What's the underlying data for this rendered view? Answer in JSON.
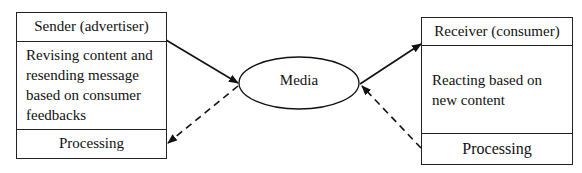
{
  "sender": {
    "title": "Sender (advertiser)",
    "body": [
      "Revising content and",
      "resending message",
      "based on consumer",
      "feedbacks"
    ],
    "footer": "Processing"
  },
  "media": {
    "label": "Media"
  },
  "receiver": {
    "title": "Receiver (consumer)",
    "body": [
      "Reacting based on",
      "new content"
    ],
    "footer": "Processing"
  },
  "arrows": [
    {
      "from": "sender",
      "to": "media",
      "style": "solid"
    },
    {
      "from": "media",
      "to": "receiver",
      "style": "solid"
    },
    {
      "from": "receiver",
      "to": "media",
      "style": "dashed"
    },
    {
      "from": "media",
      "to": "sender",
      "style": "dashed"
    }
  ]
}
